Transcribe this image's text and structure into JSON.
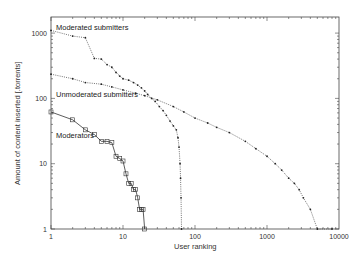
{
  "chart_data": {
    "type": "line",
    "title": "",
    "xlabel": "User ranking",
    "ylabel": "Amount of content inserted [.torrents]",
    "xscale": "log",
    "yscale": "log",
    "xlim": [
      1,
      10000
    ],
    "ylim": [
      1,
      1800
    ],
    "xticks": [
      "1",
      "10",
      "100",
      "1000",
      "10000"
    ],
    "yticks": [
      "1",
      "10",
      "100",
      "1000"
    ],
    "grid": false,
    "legend": "inline labels",
    "series": [
      {
        "name": "Moderated submitters",
        "style": "dotted",
        "marker": "dot",
        "points": [
          [
            1,
            1100
          ],
          [
            2,
            900
          ],
          [
            3,
            850
          ],
          [
            4,
            410
          ],
          [
            5,
            400
          ],
          [
            6,
            330
          ],
          [
            7,
            300
          ],
          [
            8,
            250
          ],
          [
            9,
            220
          ],
          [
            10,
            200
          ],
          [
            12,
            190
          ],
          [
            14,
            175
          ],
          [
            16,
            160
          ],
          [
            18,
            145
          ],
          [
            20,
            130
          ],
          [
            22,
            115
          ],
          [
            25,
            100
          ],
          [
            28,
            90
          ],
          [
            32,
            75
          ],
          [
            36,
            65
          ],
          [
            40,
            55
          ],
          [
            45,
            45
          ],
          [
            50,
            38
          ],
          [
            55,
            33
          ],
          [
            58,
            25
          ],
          [
            60,
            18
          ],
          [
            62,
            10
          ],
          [
            63,
            6
          ],
          [
            64,
            3
          ],
          [
            65,
            1
          ]
        ]
      },
      {
        "name": "Unmoderated submitters",
        "style": "dotted",
        "marker": "dot",
        "points": [
          [
            1,
            235
          ],
          [
            2,
            200
          ],
          [
            3,
            175
          ],
          [
            5,
            165
          ],
          [
            7,
            150
          ],
          [
            10,
            135
          ],
          [
            15,
            120
          ],
          [
            20,
            110
          ],
          [
            30,
            95
          ],
          [
            50,
            75
          ],
          [
            70,
            62
          ],
          [
            100,
            50
          ],
          [
            150,
            42
          ],
          [
            200,
            36
          ],
          [
            300,
            30
          ],
          [
            500,
            22
          ],
          [
            700,
            17
          ],
          [
            1000,
            13
          ],
          [
            1300,
            10
          ],
          [
            1600,
            8
          ],
          [
            2000,
            6
          ],
          [
            2400,
            5
          ],
          [
            2800,
            4
          ],
          [
            3200,
            3
          ],
          [
            4000,
            2
          ],
          [
            5000,
            1
          ],
          [
            8000,
            1
          ]
        ]
      },
      {
        "name": "Moderators",
        "style": "solid",
        "marker": "square",
        "points": [
          [
            1,
            62
          ],
          [
            2,
            47
          ],
          [
            3,
            33
          ],
          [
            4,
            28
          ],
          [
            5,
            22
          ],
          [
            6,
            22
          ],
          [
            7,
            21
          ],
          [
            8,
            13
          ],
          [
            9,
            12
          ],
          [
            10,
            11
          ],
          [
            11,
            7
          ],
          [
            12,
            5
          ],
          [
            13,
            5
          ],
          [
            14,
            4
          ],
          [
            15,
            4
          ],
          [
            16,
            3
          ],
          [
            17,
            2
          ],
          [
            18,
            2
          ],
          [
            19,
            2
          ],
          [
            20,
            1
          ]
        ]
      }
    ],
    "annotations": [
      {
        "text": "Moderated submitters",
        "x": 1.2,
        "y": 1500
      },
      {
        "text": "Unmoderated submitters",
        "x": 1.2,
        "y": 105
      },
      {
        "text": "Moderators",
        "x": 1.2,
        "y": 30
      }
    ]
  },
  "labels": {
    "xlabel": "User ranking",
    "ylabel": "Amount of content inserted [.torrents]",
    "series_moderated": "Moderated submitters",
    "series_unmoderated": "Unmoderated submitters",
    "series_moderators": "Moderators"
  }
}
